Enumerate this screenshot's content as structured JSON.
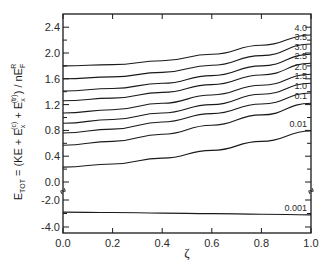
{
  "chart_data": {
    "type": "line",
    "title": "",
    "xlabel": "ζ",
    "ylabel": "E_TOT = (KE + E_x^(c) + E_x^(tr)) / nE_F^R",
    "xlim": [
      0.0,
      1.0
    ],
    "ylim_upper": [
      0.0,
      2.6
    ],
    "ylim_lower": [
      -4.2,
      -2.0
    ],
    "axis_break": "between -2.0 and 0.0",
    "grid": false,
    "legend": "inline labels at right end of curves",
    "x_ticks": [
      "0.0",
      "0.2",
      "0.4",
      "0.6",
      "0.8",
      "1.0"
    ],
    "y_ticks": [
      "2.4",
      "2.0",
      "1.6",
      "1.2",
      "0.8",
      "0.4",
      "0.0",
      "-2.0",
      "-4.0"
    ],
    "x": [
      0.0,
      0.2,
      0.4,
      0.6,
      0.8,
      1.0
    ],
    "series": [
      {
        "name": "4.0",
        "values": [
          1.8,
          1.82,
          1.88,
          1.98,
          2.12,
          2.28
        ]
      },
      {
        "name": "3.5",
        "values": [
          1.6,
          1.63,
          1.7,
          1.81,
          1.96,
          2.14
        ]
      },
      {
        "name": "3.0",
        "values": [
          1.41,
          1.45,
          1.53,
          1.65,
          1.8,
          1.98
        ]
      },
      {
        "name": "2.5",
        "values": [
          1.26,
          1.3,
          1.39,
          1.51,
          1.66,
          1.84
        ]
      },
      {
        "name": "2.0",
        "values": [
          1.07,
          1.12,
          1.22,
          1.35,
          1.5,
          1.67
        ]
      },
      {
        "name": "1.5",
        "values": [
          0.91,
          0.97,
          1.07,
          1.2,
          1.36,
          1.53
        ]
      },
      {
        "name": "1.0",
        "values": [
          0.76,
          0.82,
          0.93,
          1.06,
          1.21,
          1.38
        ]
      },
      {
        "name": "0.1",
        "values": [
          0.57,
          0.63,
          0.74,
          0.88,
          1.04,
          1.22
        ]
      },
      {
        "name": "0.01",
        "values": [
          0.23,
          0.28,
          0.37,
          0.49,
          0.63,
          0.79
        ]
      },
      {
        "name": "0.001",
        "values": [
          -2.9,
          -2.93,
          -2.97,
          -3.01,
          -3.05,
          -3.1
        ]
      }
    ]
  },
  "labels": {
    "xlabel": "ζ",
    "ylabel_main": "E",
    "ylabel_tot": "TOT",
    "ylabel_rest": " = (KE + E",
    "ylabel_x1": "x",
    "ylabel_c": "(c)",
    "ylabel_plus": " + E",
    "ylabel_x2": "x",
    "ylabel_tr": "(tr)",
    "ylabel_close": ") / nE",
    "ylabel_F": "F",
    "ylabel_R": "R"
  }
}
